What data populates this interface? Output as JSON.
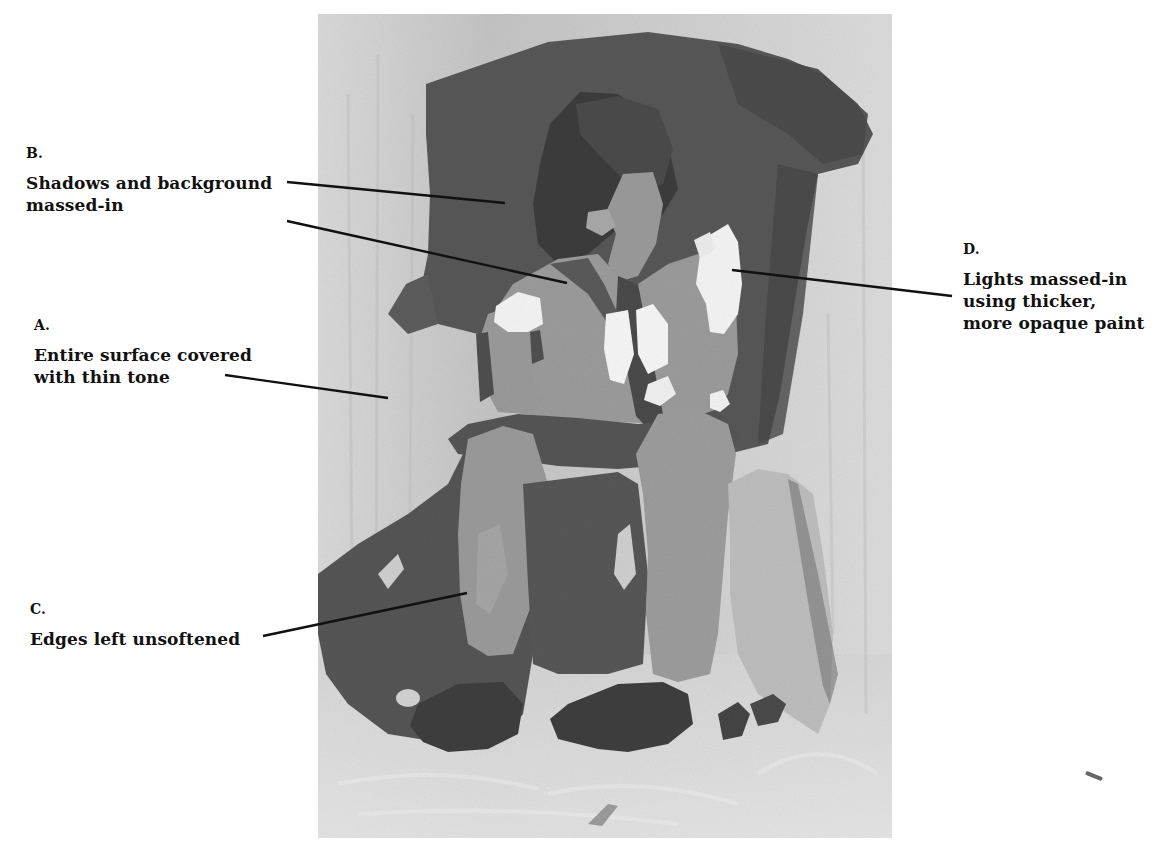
{
  "figure": {
    "tones": {
      "canvas_light": "#d8d8d8",
      "background_dark": "#565656",
      "shadow_darkest": "#3e3e3e",
      "midtone": "#9c9c9c",
      "highlight": "#f4f4f4",
      "leader_line": "#111111"
    }
  },
  "annotations": [
    {
      "id": "B",
      "letter": "B.",
      "text": "Shadows and background\nmassed-in"
    },
    {
      "id": "A",
      "letter": "A.",
      "text": "Entire surface covered\nwith thin tone"
    },
    {
      "id": "C",
      "letter": "C.",
      "text": "Edges left unsoftened"
    },
    {
      "id": "D",
      "letter": "D.",
      "text": "Lights massed-in\nusing thicker,\nmore opaque paint"
    }
  ]
}
